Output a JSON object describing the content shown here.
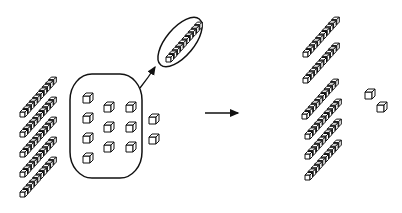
{
  "diagram": {
    "stroke_color": "#111111",
    "background": "#ffffff",
    "before": {
      "rods": 5,
      "units_circled": 10,
      "units_outside": 2,
      "rod_positions": [
        [
          20,
          117
        ],
        [
          20,
          137
        ],
        [
          20,
          157
        ],
        [
          20,
          177
        ],
        [
          20,
          197
        ]
      ],
      "unit_positions_inside": [
        [
          83,
          96
        ],
        [
          83,
          116
        ],
        [
          83,
          136
        ],
        [
          83,
          156
        ],
        [
          104,
          105
        ],
        [
          104,
          125
        ],
        [
          104,
          145
        ],
        [
          126,
          105
        ],
        [
          126,
          125
        ],
        [
          126,
          145
        ]
      ],
      "unit_positions_outside": [
        [
          149,
          117
        ],
        [
          149,
          137
        ]
      ],
      "blob": {
        "x": 70,
        "y": 74,
        "w": 72,
        "h": 104
      },
      "new_rod_ellipse": {
        "cx": 180,
        "cy": 42,
        "rx": 14,
        "ry": 30,
        "rot": 40
      },
      "new_rod_position": [
        166,
        62
      ]
    },
    "transform_arrow": {
      "x1": 205,
      "y1": 113,
      "x2": 238,
      "y2": 113
    },
    "after": {
      "rods": 6,
      "units": 2,
      "rod_positions": [
        [
          303,
          57
        ],
        [
          303,
          83
        ],
        [
          302,
          119
        ],
        [
          305,
          139
        ],
        [
          305,
          159
        ],
        [
          305,
          180
        ]
      ],
      "unit_positions": [
        [
          365,
          92
        ],
        [
          377,
          105
        ]
      ]
    }
  }
}
